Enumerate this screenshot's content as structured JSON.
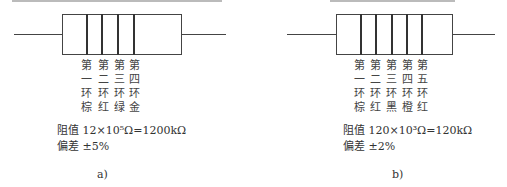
{
  "diagram_a": {
    "bands": [
      {
        "ordinal": "第",
        "num": "一",
        "ring": "环",
        "color_name": "棕"
      },
      {
        "ordinal": "第",
        "num": "二",
        "ring": "环",
        "color_name": "红"
      },
      {
        "ordinal": "第",
        "num": "三",
        "ring": "环",
        "color_name": "绿"
      },
      {
        "ordinal": "第",
        "num": "四",
        "ring": "环",
        "color_name": "金"
      }
    ],
    "resistance": "阻值 12×10⁵Ω=1200kΩ",
    "tolerance": "偏差 ±5%",
    "caption": "a)"
  },
  "diagram_b": {
    "bands": [
      {
        "ordinal": "第",
        "num": "一",
        "ring": "环",
        "color_name": "棕"
      },
      {
        "ordinal": "第",
        "num": "二",
        "ring": "环",
        "color_name": "红"
      },
      {
        "ordinal": "第",
        "num": "三",
        "ring": "环",
        "color_name": "黑"
      },
      {
        "ordinal": "第",
        "num": "四",
        "ring": "环",
        "color_name": "橙"
      },
      {
        "ordinal": "第",
        "num": "五",
        "ring": "环",
        "color_name": "红"
      }
    ],
    "resistance": "阻值 120×10³Ω=120kΩ",
    "tolerance": "偏差 ±2%",
    "caption": "b)"
  }
}
